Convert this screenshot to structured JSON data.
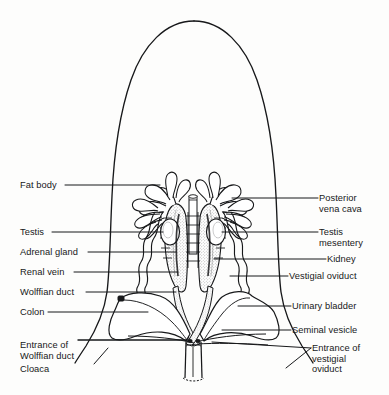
{
  "figure": {
    "domain": "anatomical-line-diagram",
    "ink_color": "#17181a",
    "background_color": "#fdfdfc",
    "stipple_color": "#4a4a4a"
  },
  "labels_left": [
    {
      "id": "fat-body",
      "text": "Fat body",
      "x": 20,
      "y": 180
    },
    {
      "id": "testis",
      "text": "Testis",
      "x": 20,
      "y": 227
    },
    {
      "id": "adrenal-gland",
      "text": "Adrenal gland",
      "x": 20,
      "y": 247
    },
    {
      "id": "renal-vein",
      "text": "Renal vein",
      "x": 20,
      "y": 267
    },
    {
      "id": "wolffian-duct",
      "text": "Wolffian duct",
      "x": 20,
      "y": 288
    },
    {
      "id": "colon",
      "text": "Colon",
      "x": 20,
      "y": 308
    },
    {
      "id": "entrance-of-wolffian-duct",
      "text": "Entrance of\nWolffian duct",
      "x": 20,
      "y": 340
    },
    {
      "id": "cloaca",
      "text": "Cloaca",
      "x": 20,
      "y": 364
    }
  ],
  "labels_right": [
    {
      "id": "posterior-vena-cava",
      "text": "Posterior\nvena cava",
      "x": 319,
      "y": 193
    },
    {
      "id": "testis-mesentery",
      "text": "Testis\nmesentery",
      "x": 319,
      "y": 227
    },
    {
      "id": "kidney",
      "text": "Kidney",
      "x": 327,
      "y": 255
    },
    {
      "id": "vestigial-oviduct",
      "text": "Vestigial oviduct",
      "x": 289,
      "y": 272
    },
    {
      "id": "urinary-bladder",
      "text": "Urinary bladder",
      "x": 292,
      "y": 302
    },
    {
      "id": "seminal-vesicle",
      "text": "Seminal vesicle",
      "x": 292,
      "y": 326
    },
    {
      "id": "entrance-of-vestigial-oviduct",
      "text": "Entrance of\nvestigial\noviduct",
      "x": 312,
      "y": 344
    }
  ],
  "structures": [
    {
      "id": "body-outline",
      "name": "Body wall outline"
    },
    {
      "id": "fat-body-left",
      "name": "Left fat body"
    },
    {
      "id": "fat-body-right",
      "name": "Right fat body"
    },
    {
      "id": "testis-left",
      "name": "Left testis"
    },
    {
      "id": "testis-right",
      "name": "Right testis"
    },
    {
      "id": "kidney-left",
      "name": "Left kidney"
    },
    {
      "id": "kidney-right",
      "name": "Right kidney"
    },
    {
      "id": "posterior-vena-cava",
      "name": "Posterior vena cava"
    },
    {
      "id": "testis-mesentery",
      "name": "Testis mesentery"
    },
    {
      "id": "wolffian-duct-left",
      "name": "Left Wolffian duct"
    },
    {
      "id": "wolffian-duct-right",
      "name": "Right Wolffian duct"
    },
    {
      "id": "vestigial-oviduct-left",
      "name": "Left vestigial oviduct"
    },
    {
      "id": "vestigial-oviduct-right",
      "name": "Right vestigial oviduct"
    },
    {
      "id": "urinary-bladder",
      "name": "Bilobed urinary bladder"
    },
    {
      "id": "colon",
      "name": "Colon"
    },
    {
      "id": "seminal-vesicle",
      "name": "Seminal vesicle"
    },
    {
      "id": "cloaca",
      "name": "Cloaca"
    }
  ]
}
